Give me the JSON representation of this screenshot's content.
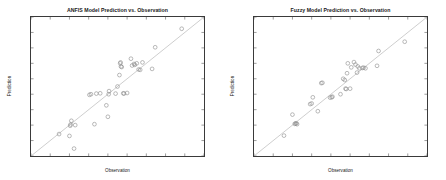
{
  "figure": {
    "width": 446,
    "height": 180,
    "background": "#ffffff",
    "axis_color": "#3a3a3a",
    "marker_color": "#8a8a8a",
    "reference_line_color": "#b8b8b8"
  },
  "chart_data": [
    {
      "type": "scatter",
      "title": "ANFIS Model Prediction vs. Observation",
      "xlabel": "Observation",
      "ylabel": "Prediction",
      "xlim": [
        35,
        80
      ],
      "ylim": [
        35,
        80
      ],
      "xticks": [
        35,
        40,
        45,
        50,
        55,
        60,
        65,
        70,
        75,
        80
      ],
      "yticks": [
        35,
        40,
        45,
        50,
        55,
        60,
        65,
        70,
        75,
        80
      ],
      "grid": false,
      "legend": "none",
      "marker": "open-circle",
      "annotations": [
        "1:1 reference line from (35,35) to (80,80)"
      ],
      "reference_line": {
        "x": [
          35,
          80
        ],
        "y": [
          35,
          80
        ]
      },
      "x": [
        42.3,
        45.0,
        45.2,
        45.3,
        45.5,
        46.2,
        46.5,
        50.2,
        50.6,
        51.5,
        52.0,
        53.0,
        54.6,
        55.0,
        55.2,
        55.3,
        57.0,
        57.5,
        58.0,
        58.2,
        58.3,
        58.4,
        58.6,
        59.0,
        59.2,
        60.0,
        61.0,
        61.3,
        61.8,
        62.0,
        62.5,
        63.0,
        63.4,
        64.0,
        66.5,
        67.3,
        74.2
      ],
      "y": [
        42.1,
        41.5,
        44.8,
        45.2,
        46.4,
        37.4,
        45.0,
        54.8,
        55.0,
        45.3,
        55.2,
        55.3,
        51.4,
        47.7,
        55.0,
        56.0,
        55.2,
        57.5,
        61.2,
        65.0,
        65.3,
        64.0,
        63.8,
        55.3,
        55.2,
        55.4,
        66.5,
        64.3,
        64.8,
        64.5,
        65.0,
        63.0,
        62.9,
        65.3,
        63.2,
        70.2,
        76.2
      ]
    },
    {
      "type": "scatter",
      "title": "Fuzzy Model Prediction vs. Observation",
      "xlabel": "Observation",
      "ylabel": "Prediction",
      "xlim": [
        35,
        80
      ],
      "ylim": [
        35,
        80
      ],
      "xticks": [
        35,
        40,
        45,
        50,
        55,
        60,
        65,
        70,
        75,
        80
      ],
      "yticks": [
        35,
        40,
        45,
        50,
        55,
        60,
        65,
        70,
        75,
        80
      ],
      "grid": false,
      "legend": "none",
      "marker": "open-circle",
      "annotations": [
        "1:1 reference line from (35,35) to (80,80)"
      ],
      "reference_line": {
        "x": [
          35,
          80
        ],
        "y": [
          35,
          80
        ]
      },
      "x": [
        42.8,
        45.0,
        45.6,
        45.8,
        46.0,
        46.2,
        49.6,
        50.0,
        50.3,
        51.6,
        52.5,
        52.8,
        54.8,
        55.2,
        55.4,
        57.5,
        58.2,
        58.6,
        58.8,
        59.0,
        59.2,
        59.4,
        60.0,
        60.3,
        61.0,
        61.4,
        61.8,
        62.0,
        62.4,
        63.2,
        63.5,
        64.0,
        67.0,
        67.4,
        74.2
      ],
      "y": [
        41.6,
        48.4,
        45.4,
        45.5,
        45.6,
        45.3,
        51.8,
        52.0,
        54.0,
        49.5,
        58.6,
        58.7,
        53.9,
        54.0,
        54.2,
        55.0,
        60.0,
        59.6,
        56.8,
        56.7,
        61.8,
        65.0,
        56.8,
        63.7,
        65.4,
        64.6,
        62.0,
        64.0,
        63.4,
        63.5,
        63.6,
        63.4,
        64.2,
        69.0,
        72.0
      ]
    }
  ]
}
